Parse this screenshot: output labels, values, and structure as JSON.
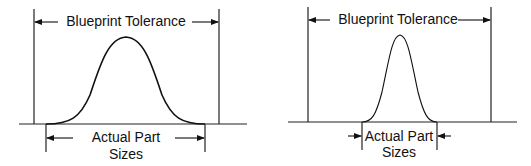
{
  "diagrams": [
    {
      "id": "wide-distribution",
      "top_label": "Blueprint Tolerance",
      "bottom_label_line1": "Actual Part",
      "bottom_label_line2": "Sizes",
      "description": "Wide bell curve: actual part size spread nearly fills blueprint tolerance"
    },
    {
      "id": "narrow-distribution",
      "top_label": "Blueprint Tolerance",
      "bottom_label_line1": "Actual Part",
      "bottom_label_line2": "Sizes",
      "description": "Narrow bell curve: actual part size spread is well within blueprint tolerance"
    }
  ],
  "colors": {
    "line": "#222222",
    "background": "#ffffff"
  }
}
